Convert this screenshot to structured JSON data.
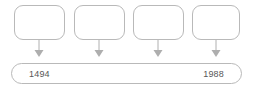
{
  "diagram": {
    "type": "timeline",
    "stroke_color": "#b9b9b9",
    "text_color": "#575757",
    "background_color": "#ffffff",
    "nodes": [
      {
        "label": ""
      },
      {
        "label": ""
      },
      {
        "label": ""
      },
      {
        "label": ""
      }
    ],
    "connectors": [
      {
        "icon": "arrow-down-icon"
      },
      {
        "icon": "arrow-down-icon"
      },
      {
        "icon": "arrow-down-icon"
      },
      {
        "icon": "arrow-down-icon"
      }
    ],
    "timeline": {
      "start_label": "1494",
      "end_label": "1988"
    }
  }
}
